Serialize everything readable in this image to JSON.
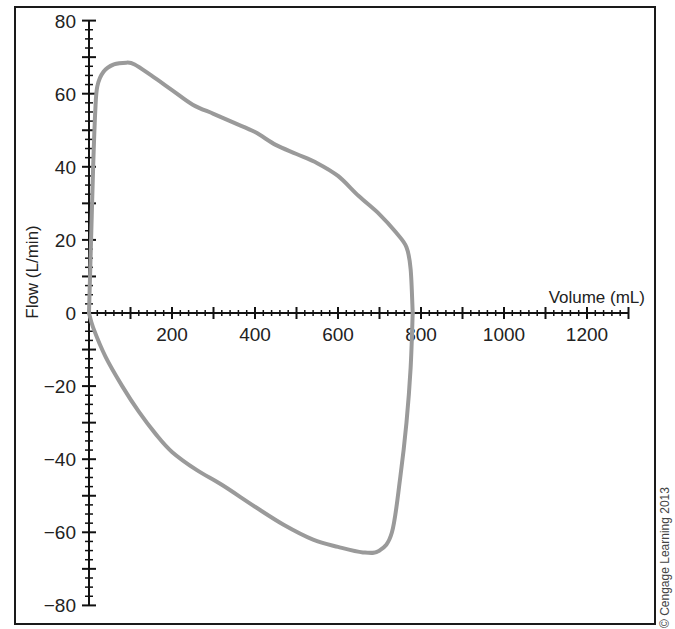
{
  "chart_data": {
    "type": "line",
    "title": "",
    "xlabel": "Volume (mL)",
    "ylabel": "Flow (L/min)",
    "xlim": [
      0,
      1300
    ],
    "ylim": [
      -80,
      80
    ],
    "x_ticks": [
      200,
      400,
      600,
      800,
      1000,
      1200
    ],
    "y_ticks": [
      80,
      60,
      40,
      20,
      0,
      -20,
      -40,
      -60,
      -80
    ],
    "x_tick_labels": [
      "200",
      "400",
      "600",
      "800",
      "1000",
      "1200"
    ],
    "y_tick_labels": [
      "80",
      "60",
      "40",
      "20",
      "0",
      "−20",
      "−40",
      "−60",
      "−80"
    ],
    "grid": false,
    "legend": null,
    "series": [
      {
        "name": "Inspiratory limb",
        "color": "#9a9a9a",
        "points": [
          [
            0,
            0
          ],
          [
            5,
            20
          ],
          [
            10,
            40
          ],
          [
            15,
            55
          ],
          [
            20,
            62
          ],
          [
            35,
            66
          ],
          [
            60,
            68
          ],
          [
            90,
            68.5
          ],
          [
            110,
            68
          ],
          [
            150,
            65
          ],
          [
            200,
            61
          ],
          [
            250,
            57
          ],
          [
            300,
            54.5
          ],
          [
            350,
            52
          ],
          [
            400,
            49.5
          ],
          [
            450,
            46
          ],
          [
            500,
            43.5
          ],
          [
            550,
            41
          ],
          [
            600,
            37.5
          ],
          [
            650,
            32
          ],
          [
            700,
            27
          ],
          [
            740,
            22
          ],
          [
            765,
            18
          ],
          [
            775,
            12
          ],
          [
            780,
            0
          ]
        ]
      },
      {
        "name": "Expiratory limb",
        "color": "#9a9a9a",
        "points": [
          [
            0,
            0
          ],
          [
            10,
            -4
          ],
          [
            40,
            -12
          ],
          [
            80,
            -20
          ],
          [
            120,
            -27
          ],
          [
            160,
            -33
          ],
          [
            200,
            -38
          ],
          [
            260,
            -43
          ],
          [
            320,
            -47
          ],
          [
            400,
            -53
          ],
          [
            470,
            -58
          ],
          [
            540,
            -62
          ],
          [
            600,
            -64
          ],
          [
            660,
            -65.5
          ],
          [
            700,
            -65
          ],
          [
            730,
            -60
          ],
          [
            750,
            -45
          ],
          [
            765,
            -30
          ],
          [
            775,
            -15
          ],
          [
            780,
            0
          ]
        ]
      }
    ],
    "annotations": [
      "© Cengage Learning 2013"
    ]
  },
  "copyright": "© Cengage Learning 2013"
}
